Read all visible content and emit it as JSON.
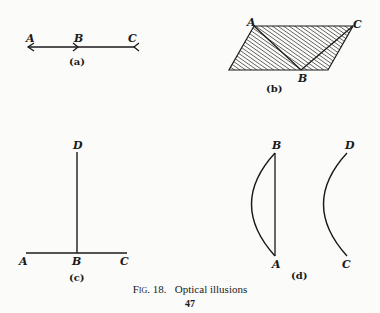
{
  "figures": {
    "a": {
      "sublabel": "(a)",
      "points": {
        "A": "A",
        "B": "B",
        "C": "C"
      }
    },
    "b": {
      "sublabel": "(b)",
      "points": {
        "A": "A",
        "B": "B",
        "C": "C"
      }
    },
    "c": {
      "sublabel": "(c)",
      "points": {
        "A": "A",
        "B": "B",
        "C": "C",
        "D": "D"
      }
    },
    "d": {
      "sublabel": "(d)",
      "points": {
        "A": "A",
        "B": "B",
        "C": "C",
        "D": "D"
      }
    }
  },
  "caption": {
    "figure_number": "Fig. 18.",
    "title": "Optical illusions"
  },
  "page_number": "47",
  "colors": {
    "ink": "#1a1a1a",
    "paper": "#fbfbfa"
  }
}
